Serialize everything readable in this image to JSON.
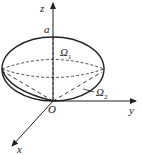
{
  "diagram": {
    "axes": {
      "z_label": "z",
      "y_label": "y",
      "x_label": "x",
      "origin_label": "O"
    },
    "labels": {
      "top_point": "a",
      "region_upper": "Ω",
      "region_upper_sub": "1",
      "region_lower": "Ω",
      "region_lower_sub": "2"
    },
    "colors": {
      "stroke": "#222222",
      "background": "#ffffff"
    }
  }
}
